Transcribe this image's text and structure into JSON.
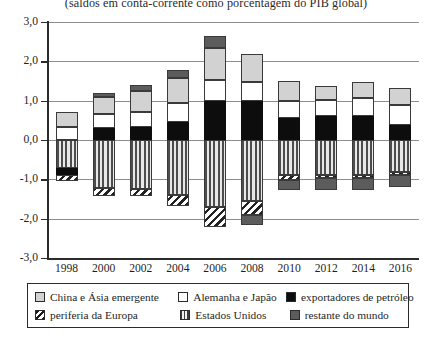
{
  "chart_data": {
    "type": "bar",
    "title": "(saldos em conta-corrente como porcentagem do PIB global)",
    "xlabel": "",
    "ylabel": "",
    "stacked": true,
    "grid": true,
    "legend_position": "bottom",
    "ylim": [
      -3.0,
      3.0
    ],
    "ytick_labels": [
      "3,0",
      "2,0",
      "1,0",
      "0,0",
      "-1,0",
      "-2,0",
      "-3,0"
    ],
    "ytick_values": [
      3.0,
      2.0,
      1.0,
      0.0,
      -1.0,
      -2.0,
      -3.0
    ],
    "categories": [
      "1998",
      "2000",
      "2002",
      "2004",
      "2006",
      "2008",
      "2010",
      "2012",
      "2014",
      "2016"
    ],
    "series": [
      {
        "name": "China e Ásia emergente",
        "key": "china",
        "values": [
          0.37,
          0.45,
          0.52,
          0.62,
          0.82,
          0.7,
          0.5,
          0.35,
          0.4,
          0.45
        ]
      },
      {
        "name": "Alemanha e Japão",
        "key": "germany",
        "values": [
          0.33,
          0.35,
          0.4,
          0.5,
          0.52,
          0.5,
          0.45,
          0.42,
          0.48,
          0.5
        ]
      },
      {
        "name": "exportadores de petróleo",
        "key": "oil",
        "values": [
          0.0,
          0.3,
          0.32,
          0.45,
          1.0,
          0.98,
          0.55,
          0.6,
          0.6,
          0.38
        ]
      },
      {
        "name": "restante do mundo",
        "key": "row",
        "values": [
          0.0,
          0.1,
          0.15,
          0.2,
          0.3,
          0.0,
          0.0,
          0.0,
          0.0,
          0.0
        ]
      },
      {
        "name": "Estados Unidos",
        "key": "usa",
        "values": [
          -0.72,
          -1.22,
          -1.25,
          -1.4,
          -1.7,
          -1.55,
          -0.9,
          -0.88,
          -0.9,
          -0.82
        ]
      },
      {
        "name": "periferia da Europa",
        "key": "periphery",
        "values": [
          -0.13,
          -0.2,
          -0.17,
          -0.28,
          -0.52,
          -0.35,
          -0.12,
          -0.08,
          -0.07,
          -0.06
        ]
      },
      {
        "name": "restante do mundo (negativo)",
        "key": "row_neg",
        "values": [
          0.0,
          0.0,
          0.0,
          0.0,
          0.0,
          -0.25,
          -0.25,
          -0.3,
          -0.3,
          -0.32
        ]
      }
    ],
    "series_negative_oil": [
      -0.18,
      0.0,
      0.0,
      0.0,
      0.0,
      0.0,
      0.0,
      0.0,
      0.0,
      0.0
    ]
  },
  "legend": {
    "rows": [
      [
        {
          "label": "China e Ásia emergente",
          "key": "china"
        },
        {
          "label": "Alemanha e Japão",
          "key": "germany"
        },
        {
          "label": "exportadores de petróleo",
          "key": "oil"
        }
      ],
      [
        {
          "label": "periferia da Europa",
          "key": "periphery"
        },
        {
          "label": "Estados Unidos",
          "key": "usa"
        },
        {
          "label": "restante do mundo",
          "key": "row"
        }
      ]
    ]
  },
  "colors": {
    "china": "#d2d2d2",
    "germany": "#ffffff",
    "oil": "#0d0d0d",
    "row": "#5c5c5c",
    "usa": "#4d4d4d",
    "periphery": "#222222",
    "axis": "#2b2b2b",
    "grid": "#8e8e8e"
  }
}
